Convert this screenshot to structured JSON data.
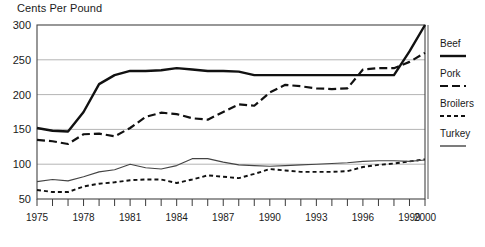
{
  "chart_data": {
    "type": "line",
    "title": "Cents Per Pound",
    "xlabel": "",
    "ylabel": "Cents Per Pound",
    "grid": true,
    "legend_position": "right",
    "xlim": [
      1975,
      2000
    ],
    "ylim": [
      50,
      300
    ],
    "yticks": [
      50,
      100,
      150,
      200,
      250,
      300
    ],
    "ytick_labels": [
      "50",
      "100",
      "150",
      "200",
      "250",
      "300"
    ],
    "xticks": [
      1975,
      1976,
      1977,
      1978,
      1979,
      1980,
      1981,
      1982,
      1983,
      1984,
      1985,
      1986,
      1987,
      1988,
      1989,
      1990,
      1991,
      1992,
      1993,
      1994,
      1995,
      1996,
      1997,
      1998,
      1999,
      2000
    ],
    "xtick_labels": [
      "1975",
      "1978",
      "1981",
      "1984",
      "1987",
      "1990",
      "1993",
      "1996",
      "1999",
      "2000"
    ],
    "xtick_labeled_years": [
      1975,
      1978,
      1981,
      1984,
      1987,
      1990,
      1993,
      1996,
      1999,
      2000
    ],
    "x": [
      1975,
      1976,
      1977,
      1978,
      1979,
      1980,
      1981,
      1982,
      1983,
      1984,
      1985,
      1986,
      1987,
      1988,
      1989,
      1990,
      1991,
      1992,
      1993,
      1994,
      1995,
      1996,
      1997,
      1998,
      1999,
      2000
    ],
    "series": [
      {
        "name": "Beef",
        "style": "solid-thick",
        "color": "#111111",
        "values": [
          152,
          148,
          147,
          175,
          215,
          228,
          234,
          234,
          235,
          238,
          236,
          234,
          234,
          233,
          228,
          228,
          228,
          228,
          228,
          228,
          228,
          228,
          228,
          228,
          262,
          300
        ]
      },
      {
        "name": "Pork",
        "style": "dashed",
        "color": "#111111",
        "values": [
          135,
          133,
          129,
          143,
          144,
          140,
          152,
          168,
          174,
          172,
          166,
          164,
          175,
          186,
          184,
          203,
          214,
          212,
          209,
          208,
          209,
          236,
          238,
          238,
          247,
          260
        ]
      },
      {
        "name": "Broilers",
        "style": "dotted-dash",
        "color": "#111111",
        "values": [
          63,
          60,
          60,
          68,
          72,
          74,
          77,
          78,
          78,
          73,
          78,
          84,
          82,
          80,
          86,
          93,
          91,
          89,
          89,
          89,
          90,
          96,
          99,
          101,
          104,
          107
        ]
      },
      {
        "name": "Turkey",
        "style": "solid-thin",
        "color": "#444444",
        "values": [
          75,
          78,
          76,
          82,
          89,
          92,
          100,
          95,
          93,
          98,
          108,
          108,
          103,
          99,
          98,
          97,
          98,
          99,
          100,
          101,
          102,
          104,
          105,
          105,
          104,
          106
        ]
      }
    ]
  },
  "legend": {
    "items": [
      {
        "label": "Beef",
        "swatch": "solid-thick"
      },
      {
        "label": "Pork",
        "swatch": "dashed"
      },
      {
        "label": "Broilers",
        "swatch": "dotted-dash"
      },
      {
        "label": "Turkey",
        "swatch": "solid-thin"
      }
    ]
  }
}
